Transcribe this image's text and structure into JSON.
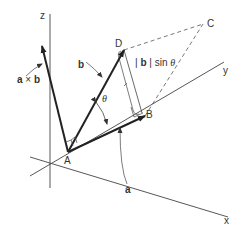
{
  "diagram": {
    "colors": {
      "stroke": "#333333",
      "vector": "#222222",
      "background": "#ffffff"
    },
    "axes": {
      "x_label": "x",
      "y_label": "y",
      "z_label": "z"
    },
    "points": {
      "A": "A",
      "B": "B",
      "C": "C",
      "D": "D"
    },
    "vectors": {
      "a": "a",
      "b": "b",
      "cross": {
        "left": "a",
        "op": "×",
        "right": "b"
      }
    },
    "angle": "θ",
    "height_label": {
      "bar_open": "|",
      "vec": "b",
      "bar_close": "|",
      "func": "sin",
      "angle": "θ"
    }
  }
}
